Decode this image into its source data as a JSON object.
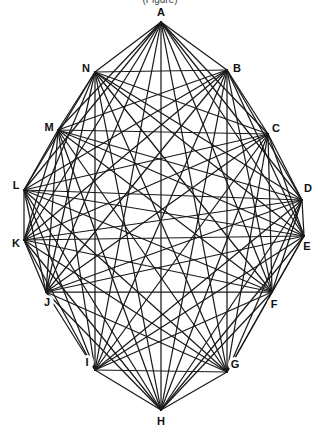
{
  "diagram": {
    "type": "complete-graph",
    "caption_partial": "(Figure)",
    "node_count": 14,
    "nodes": [
      "A",
      "B",
      "C",
      "D",
      "E",
      "F",
      "G",
      "H",
      "I",
      "J",
      "K",
      "L",
      "M",
      "N"
    ],
    "edges": "all-pairs",
    "edge_color": "#1a1a1a",
    "label_color": "#111111",
    "background": "#ffffff"
  }
}
